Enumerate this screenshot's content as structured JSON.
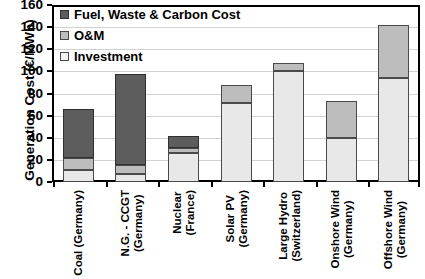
{
  "chart_data": {
    "type": "bar",
    "stacked": true,
    "title": "",
    "xlabel": "",
    "ylabel": "Generation Cost (€/MWh)",
    "ylim": [
      0,
      160
    ],
    "yticks": [
      0,
      20,
      40,
      60,
      80,
      100,
      120,
      140,
      160
    ],
    "grid": true,
    "legend_position": "top-left",
    "categories": [
      "Coal (Germany)",
      "N.G. - CCGT (Germany)",
      "Nuclear (France)",
      "Solar PV (Germany)",
      "Large Hydro (Switzerland)",
      "Onshore Wind (Germany)",
      "Offshore Wind (Germany)"
    ],
    "category_lines": [
      [
        "Coal (Germany)"
      ],
      [
        "N.G. - CCGT",
        "(Germany)"
      ],
      [
        "Nuclear",
        "(France)"
      ],
      [
        "Solar PV",
        "(Germany)"
      ],
      [
        "Large Hydro",
        "(Switzerland)"
      ],
      [
        "Onshore Wind",
        "(Germany)"
      ],
      [
        "Offshore Wind",
        "(Germany)"
      ]
    ],
    "series": [
      {
        "name": "Investment",
        "color": "#e8e8e8",
        "values": [
          11,
          7,
          26,
          71,
          100,
          40,
          94
        ]
      },
      {
        "name": "O&M",
        "color": "#bdbdbd",
        "values": [
          11,
          8,
          5,
          17,
          8,
          33,
          48
        ]
      },
      {
        "name": "Fuel, Waste & Carbon Cost",
        "color": "#5d5d5d",
        "values": [
          44,
          83,
          11,
          0,
          0,
          0,
          0
        ]
      }
    ],
    "totals": [
      66,
      98,
      42,
      88,
      108,
      73,
      142
    ],
    "cumulative_boundaries": [
      {
        "category": "Coal (Germany)",
        "investment_top": 11,
        "om_top": 22,
        "total": 66
      },
      {
        "category": "N.G. - CCGT (Germany)",
        "investment_top": 7,
        "om_top": 15,
        "total": 98
      },
      {
        "category": "Nuclear (France)",
        "investment_top": 26,
        "om_top": 31,
        "total": 42
      },
      {
        "category": "Solar PV (Germany)",
        "investment_top": 71,
        "om_top": 88,
        "total": 88
      },
      {
        "category": "Large Hydro (Switzerland)",
        "investment_top": 100,
        "om_top": 108,
        "total": 108
      },
      {
        "category": "Onshore Wind (Germany)",
        "investment_top": 40,
        "om_top": 73,
        "total": 73
      },
      {
        "category": "Offshore Wind (Germany)",
        "investment_top": 94,
        "om_top": 142,
        "total": 142
      }
    ]
  },
  "legend": {
    "items": [
      {
        "label": "Fuel, Waste & Carbon Cost",
        "key": "fuel"
      },
      {
        "label": "O&M",
        "key": "om"
      },
      {
        "label": "Investment",
        "key": "inv"
      }
    ]
  },
  "axis": {
    "y_title": "Generation Cost (€/MWh)",
    "y_tick_labels": [
      "160",
      "140",
      "120",
      "100",
      "80",
      "60",
      "40",
      "20",
      "0"
    ]
  },
  "colors": {
    "fuel": "#5d5d5d",
    "om": "#bdbdbd",
    "investment": "#e8e8e8",
    "axis": "#000000",
    "grid": "#d2d2d2",
    "background": "#ffffff"
  }
}
